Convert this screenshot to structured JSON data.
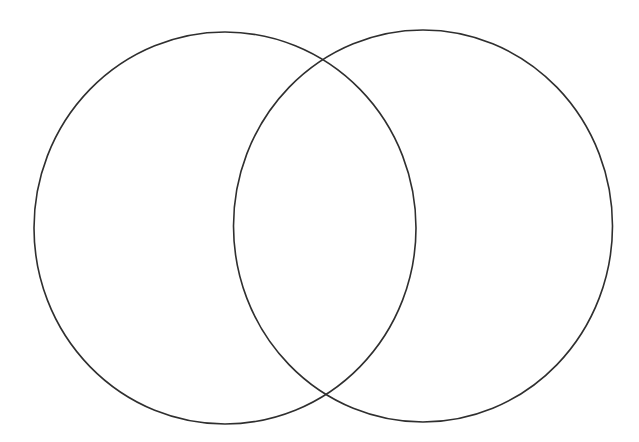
{
  "diagram": {
    "type": "venn",
    "sets": 2,
    "background_color": "#ffffff",
    "stroke_color": "#2f2f2f",
    "circles": [
      {
        "id": "left",
        "label": "",
        "cx": 225,
        "cy": 228,
        "rx": 191,
        "ry": 196
      },
      {
        "id": "right",
        "label": "",
        "cx": 423,
        "cy": 226,
        "rx": 189.5,
        "ry": 196
      }
    ],
    "intersection_label": ""
  }
}
